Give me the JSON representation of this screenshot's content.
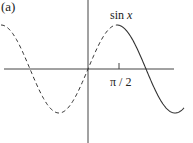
{
  "figure": {
    "panel_label": "(a)",
    "function_label_name": "sin",
    "function_label_var": "x",
    "tick_label": "π / 2",
    "colors": {
      "axis": "#444444",
      "curve": "#333333",
      "text": "#222222"
    }
  },
  "chart_data": {
    "type": "line",
    "title": "(a)",
    "xlabel": "",
    "ylabel": "",
    "annotations": [
      "sin x",
      "π / 2"
    ],
    "x_ticks": [
      {
        "value": 1.5708,
        "label": "π / 2"
      }
    ],
    "series": [
      {
        "name": "sin x (dashed, x < π/2)",
        "style": "dashed",
        "x_range": [
          -4.71,
          1.57
        ],
        "function": "sin(x)"
      },
      {
        "name": "sin x (solid, x ≥ π/2)",
        "style": "solid",
        "x_range": [
          1.57,
          5.2
        ],
        "function": "sin(x)"
      }
    ],
    "xlim": [
      -5.3,
      5.3
    ],
    "ylim": [
      -1.5,
      1.5
    ],
    "grid": false,
    "legend": "none"
  }
}
